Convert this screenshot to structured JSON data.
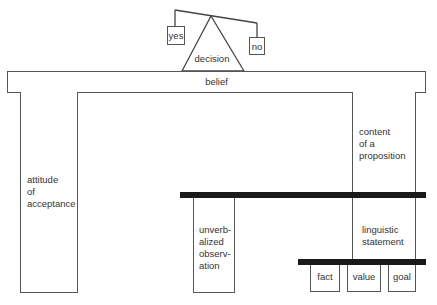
{
  "diagram": {
    "decision": {
      "label": "decision",
      "options": [
        {
          "id": "yes",
          "label": "yes"
        },
        {
          "id": "no",
          "label": "no"
        }
      ]
    },
    "belief": {
      "label": "belief"
    },
    "columns": {
      "attitude": {
        "lines": [
          "attitude",
          "of",
          "acceptance"
        ]
      },
      "content": {
        "lines": [
          "content",
          "of a",
          "proposition"
        ]
      },
      "unverbalized": {
        "lines": [
          "unverb-",
          "alized",
          "observ-",
          "ation"
        ]
      },
      "linguistic": {
        "lines": [
          "linguistic",
          "statement"
        ]
      }
    },
    "statement_types": [
      {
        "label": "fact"
      },
      {
        "label": "value"
      },
      {
        "label": "goal"
      }
    ],
    "colors": {
      "line": "#555555",
      "thick_bar": "#1a1a1a",
      "text": "#333333",
      "background": "#ffffff"
    }
  }
}
